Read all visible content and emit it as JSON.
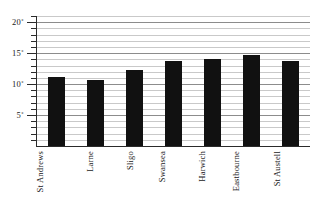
{
  "chart_data": {
    "type": "bar",
    "title": "",
    "subtitle": "",
    "xlabel": "",
    "ylabel": "",
    "categories": [
      "St Andrews",
      "Larne",
      "Sligo",
      "Swansea",
      "Harwich",
      "Eastbourne",
      "St Austell"
    ],
    "values": [
      11.2,
      10.6,
      12.2,
      13.7,
      14.0,
      14.7,
      13.7
    ],
    "ylim": [
      0,
      21
    ],
    "ytick_values": [
      5,
      10,
      15,
      20
    ],
    "ytick_labels": [
      "5˚",
      "10˚",
      "15˚",
      "20˚"
    ],
    "minor_tick_step": 1,
    "grid": true,
    "grid_major_values": [
      5,
      10,
      15,
      20
    ],
    "legend": "none",
    "bar_color": "#111111",
    "grid_color": "#c9c9c9",
    "grid_major_color": "#8c8c8c",
    "axis_color": "#2b2b2b",
    "background_color": "#ffffff",
    "unit_symbol": "˚"
  }
}
